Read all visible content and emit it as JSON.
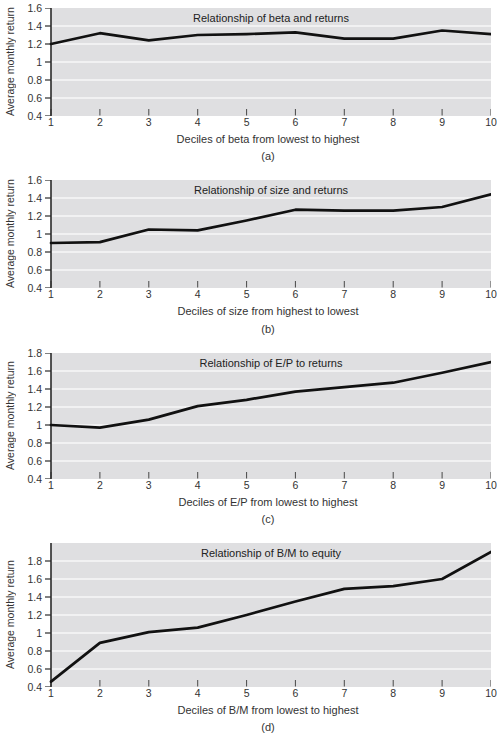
{
  "colors": {
    "plot_bg": "#dfdfe1",
    "grid": "#f7f7f7",
    "line": "#111111",
    "axis": "#2a2a2a",
    "tick": "#555555",
    "text": "#333333"
  },
  "chart_data": [
    {
      "type": "line",
      "panel": "(a)",
      "title": "Relationship of beta and returns",
      "xlabel": "Deciles of beta from lowest to highest",
      "ylabel": "Average monthly return",
      "categories": [
        1,
        2,
        3,
        4,
        5,
        6,
        7,
        8,
        9,
        10
      ],
      "values": [
        1.2,
        1.32,
        1.24,
        1.3,
        1.31,
        1.33,
        1.26,
        1.26,
        1.35,
        1.31
      ],
      "ylim": [
        0.4,
        1.6
      ],
      "yticks": [
        0.4,
        0.6,
        0.8,
        1,
        1.2,
        1.4,
        1.6
      ],
      "grid": true,
      "legend": "none"
    },
    {
      "type": "line",
      "panel": "(b)",
      "title": "Relationship of size and returns",
      "xlabel": "Deciles of size from highest to lowest",
      "ylabel": "Average monthly return",
      "categories": [
        1,
        2,
        3,
        4,
        5,
        6,
        7,
        8,
        9,
        10
      ],
      "values": [
        0.9,
        0.91,
        1.05,
        1.04,
        1.15,
        1.27,
        1.26,
        1.26,
        1.3,
        1.44
      ],
      "ylim": [
        0.4,
        1.6
      ],
      "yticks": [
        0.4,
        0.6,
        0.8,
        1,
        1.2,
        1.4,
        1.6
      ],
      "grid": true,
      "legend": "none"
    },
    {
      "type": "line",
      "panel": "(c)",
      "title": "Relationship of E/P to returns",
      "xlabel": "Deciles of E/P from lowest to highest",
      "ylabel": "Average monthly return",
      "categories": [
        1,
        2,
        3,
        4,
        5,
        6,
        7,
        8,
        9,
        10
      ],
      "values": [
        1.0,
        0.97,
        1.06,
        1.21,
        1.28,
        1.37,
        1.42,
        1.47,
        1.58,
        1.7
      ],
      "ylim": [
        0.4,
        1.8
      ],
      "yticks": [
        0.4,
        0.6,
        0.8,
        1,
        1.2,
        1.4,
        1.6,
        1.8
      ],
      "grid": true,
      "legend": "none"
    },
    {
      "type": "line",
      "panel": "(d)",
      "title": "Relationship of B/M to equity",
      "xlabel": "Deciles of B/M from lowest to highest",
      "ylabel": "Average monthly return",
      "categories": [
        1,
        2,
        3,
        4,
        5,
        6,
        7,
        8,
        9,
        10
      ],
      "values": [
        0.46,
        0.89,
        1.01,
        1.06,
        1.2,
        1.35,
        1.49,
        1.52,
        1.6,
        1.9
      ],
      "ylim": [
        0.4,
        2.0
      ],
      "yticks": [
        0.4,
        0.6,
        0.8,
        1,
        1.2,
        1.4,
        1.6,
        1.8
      ],
      "grid": true,
      "legend": "none"
    }
  ]
}
